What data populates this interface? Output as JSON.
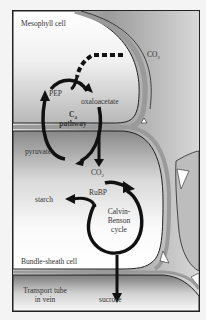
{
  "diagram": {
    "cells": {
      "mesophyll": "Mesophyll cell",
      "bundle_sheath": "Bundle-sheath cell",
      "transport_line1": "Transport tube",
      "transport_line2": "in vein"
    },
    "molecules": {
      "co2_in": "CO",
      "co2_in_sub": "2",
      "pep": "PEP",
      "oxaloacetate": "oxaloacetate",
      "pyruvate": "pyruvate",
      "co2_released": "CO",
      "co2_released_sub": "2",
      "rubp": "RuBP",
      "starch": "starch",
      "sucrose": "sucrose"
    },
    "pathways": {
      "c4_line1": "C",
      "c4_sub": "4",
      "c4_line2": "pathway",
      "calvin_line1": "Calvin-",
      "calvin_line2": "Benson",
      "calvin_line3": "cycle"
    },
    "colors": {
      "arrow": "#111111",
      "cell_wall": "#9a9a9a",
      "outline": "#222222"
    }
  }
}
